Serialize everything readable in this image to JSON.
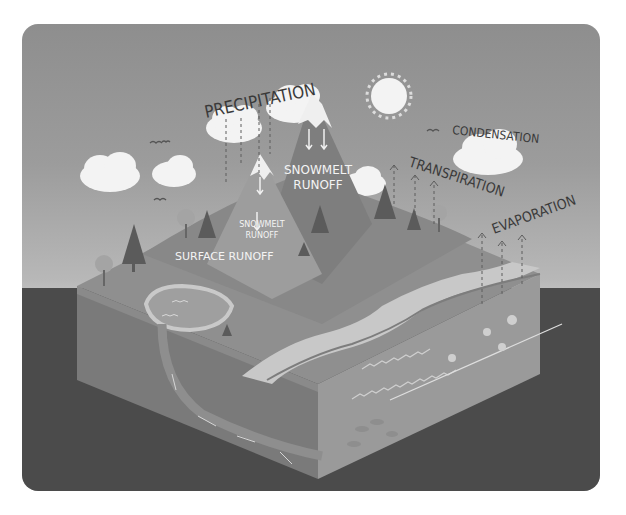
{
  "diagram": {
    "labels": {
      "precipitation": "PRECIPITATION",
      "condensation": "CONDENSATION",
      "transpiration": "TRANSPIRATION",
      "evaporation": "EVAPORATION",
      "snowmelt_runoff_large_1": "SNOWMELT",
      "snowmelt_runoff_large_2": "RUNOFF",
      "snowmelt_runoff_small_1": "SNOWMELT",
      "snowmelt_runoff_small_2": "RUNOFF",
      "surface_runoff": "SURFACE RUNOFF"
    },
    "elements": [
      "sun",
      "clouds",
      "birds",
      "mountains",
      "trees",
      "lake",
      "river",
      "ocean",
      "groundwater-flow-arrows",
      "jellyfish",
      "fish"
    ],
    "colors": {
      "sky_top": "#8e8e8e",
      "sky_bottom": "#d2d2d2",
      "ground": "#4b4b4b",
      "land_top": "#8f8f8f",
      "block_front": "#7a7a7a",
      "block_side": "#9a9a9a",
      "cloud": "#f4f4f4",
      "text": "#3a3a3a"
    }
  }
}
